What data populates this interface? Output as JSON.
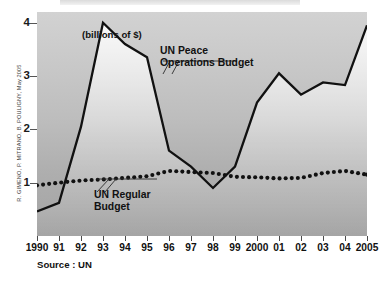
{
  "units_caption": "(billions of $)",
  "source_note": "Source : UN",
  "credit": "R. GIMENO, P. MITRANO, B. POULIGNY, May 2005",
  "annotations": {
    "peace_line1": "UN Peace",
    "peace_line2": "Operations Budget",
    "regular_line1": "UN Regular",
    "regular_line2": "Budget"
  },
  "colors": {
    "line": "#111111",
    "plot_top": "#d2d2d2",
    "plot_bottom": "#a3a3a3",
    "text": "#111111"
  },
  "chart_data": {
    "type": "line",
    "title": "",
    "xlabel": "",
    "ylabel": "billions of $",
    "ylim": [
      0,
      4.2
    ],
    "yticks": [
      1,
      2,
      3,
      4
    ],
    "ytick_labels": [
      "1",
      "2",
      "3",
      "4"
    ],
    "grid": false,
    "legend": "annotated-inline",
    "x": [
      1990,
      1991,
      1992,
      1993,
      1994,
      1995,
      1996,
      1997,
      1998,
      1999,
      2000,
      2001,
      2002,
      2003,
      2004,
      2005
    ],
    "categories": [
      "1990",
      "91",
      "92",
      "93",
      "94",
      "95",
      "96",
      "97",
      "98",
      "99",
      "2000",
      "01",
      "02",
      "03",
      "04",
      "2005"
    ],
    "series": [
      {
        "name": "UN Peace Operations Budget",
        "style": "solid",
        "values": [
          0.46,
          0.62,
          2.05,
          4.0,
          3.6,
          3.35,
          1.6,
          1.3,
          0.9,
          1.3,
          2.5,
          3.05,
          2.65,
          2.88,
          2.83,
          3.95
        ]
      },
      {
        "name": "UN Regular Budget",
        "style": "dotted",
        "values": [
          0.95,
          1.0,
          1.04,
          1.06,
          1.09,
          1.12,
          1.22,
          1.2,
          1.18,
          1.11,
          1.1,
          1.08,
          1.09,
          1.18,
          1.22,
          1.15
        ]
      }
    ]
  }
}
